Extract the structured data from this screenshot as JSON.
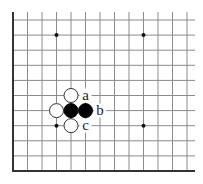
{
  "board": {
    "origin_x": 13,
    "origin_y": 20,
    "spacing_x": 14.5,
    "spacing_y": 15.1,
    "cols": 13,
    "rows": 11,
    "top_overhang": 8,
    "right_overhang": 8,
    "line_color": "#8a8a8a",
    "edge_color": "#333333",
    "edges": [
      "left",
      "bottom"
    ]
  },
  "star_points": [
    [
      3,
      1
    ],
    [
      9,
      1
    ],
    [
      3,
      7
    ],
    [
      9,
      7
    ]
  ],
  "stones": [
    {
      "col": 4,
      "row": 5,
      "color": "white"
    },
    {
      "col": 3,
      "row": 6,
      "color": "white"
    },
    {
      "col": 4,
      "row": 6,
      "color": "black"
    },
    {
      "col": 5,
      "row": 6,
      "color": "black"
    },
    {
      "col": 4,
      "row": 7,
      "color": "white"
    }
  ],
  "labels": [
    {
      "col": 5,
      "row": 5,
      "text": "a"
    },
    {
      "col": 6,
      "row": 6,
      "text": "b"
    },
    {
      "col": 5,
      "row": 7,
      "text": "c"
    }
  ]
}
